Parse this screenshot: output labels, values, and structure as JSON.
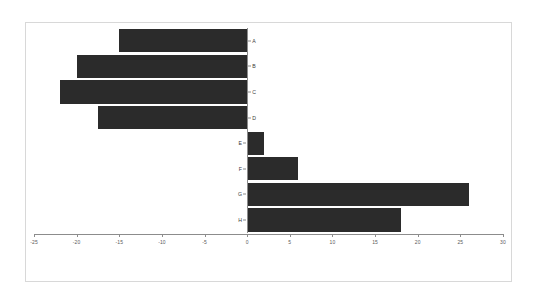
{
  "chart_data": {
    "type": "bar",
    "orientation": "horizontal",
    "title": "",
    "xlabel": "",
    "ylabel": "",
    "categories": [
      "A",
      "B",
      "C",
      "D",
      "E",
      "F",
      "G",
      "H"
    ],
    "values": [
      -15,
      -20,
      -22,
      -17.5,
      2,
      6,
      26,
      18
    ],
    "xlim": [
      -25,
      30
    ],
    "xticks": [
      -25,
      -20,
      -15,
      -10,
      -5,
      0,
      5,
      10,
      15,
      20,
      25,
      30
    ],
    "xtick_labels": [
      "-25",
      "-20",
      "-15",
      "-10",
      "-5",
      "0",
      "5",
      "10",
      "15",
      "20",
      "25",
      "30"
    ],
    "grid": false,
    "legend": null,
    "bar_color": "#2b2b2b",
    "axis_color": "#8c8c8c",
    "frame_color": "#d8d8d8",
    "background_color": "#ffffff",
    "zero_reference": 0
  }
}
